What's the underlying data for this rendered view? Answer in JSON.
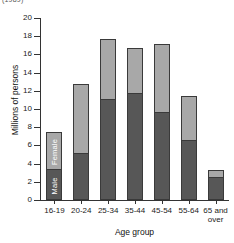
{
  "top_caption": "(1989)",
  "chart_data": {
    "type": "bar",
    "subtype": "stacked-bar",
    "title": "",
    "xlabel": "Age group",
    "ylabel": "Millions of persons",
    "ylim": [
      0,
      20
    ],
    "yticks": [
      0,
      2,
      4,
      6,
      8,
      10,
      12,
      14,
      16,
      18,
      20
    ],
    "grid": false,
    "legend": "in-bar labels on first bar",
    "categories": [
      "16-19",
      "20-24",
      "25-34",
      "35-44",
      "45-54",
      "55-64",
      "65 and\nover"
    ],
    "series": [
      {
        "name": "Male",
        "color": "#575757",
        "values": [
          3.3,
          5.05,
          11.0,
          11.6,
          9.6,
          6.45,
          2.45
        ]
      },
      {
        "name": "Female",
        "color": "#a8a8a8",
        "values": [
          4.2,
          7.7,
          6.7,
          5.1,
          7.5,
          4.95,
          0.85
        ]
      }
    ],
    "totals": [
      7.5,
      12.75,
      17.7,
      16.7,
      17.1,
      11.4,
      3.3
    ],
    "annotations": [
      {
        "text": "Female",
        "bar": "16-19",
        "segment": "Female"
      },
      {
        "text": "Male",
        "bar": "16-19",
        "segment": "Male"
      }
    ]
  }
}
